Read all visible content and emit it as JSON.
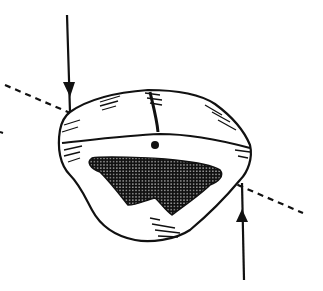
{
  "figure": {
    "type": "line-illustration",
    "colors": {
      "ink": "#111111",
      "background": "#ffffff"
    },
    "elements": {
      "top_arrow": {
        "direction": "down",
        "x": 67,
        "y_start": 15,
        "y_end": 110
      },
      "bottom_arrow": {
        "direction": "up",
        "x": 242,
        "y_start": 278,
        "y_end": 183
      },
      "axis_line": {
        "style": "dashed",
        "from": [
          5,
          85
        ],
        "to": [
          303,
          213
        ]
      },
      "center_dot": {
        "cx": 155,
        "cy": 145
      }
    }
  }
}
